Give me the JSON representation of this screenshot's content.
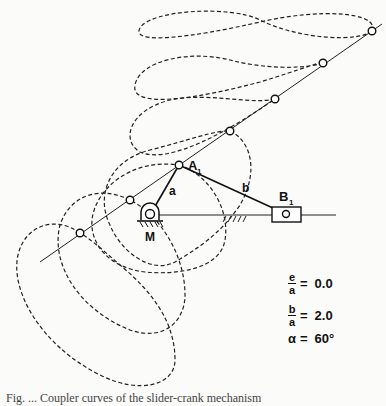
{
  "labels": {
    "crank_pivot": "M",
    "coupler_joint": "A",
    "coupler_joint_sub": "1",
    "slider": "B",
    "slider_sub": "1",
    "crank_link": "a",
    "coupler_link": "b"
  },
  "parameters": {
    "e_over_a": {
      "num": "e",
      "den": "a",
      "eq": "=",
      "value": "0.0"
    },
    "b_over_a": {
      "num": "b",
      "den": "a",
      "eq": "=",
      "value": "2.0"
    },
    "alpha": {
      "symbol": "α",
      "eq": "=",
      "value": "60°"
    }
  },
  "caption": "Fig. ... Coupler curves of the slider-crank mechanism",
  "colors": {
    "ink": "#111111",
    "paper": "#fbfbf9"
  }
}
